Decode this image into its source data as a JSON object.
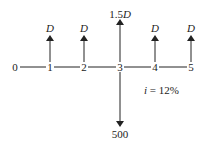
{
  "diagram": {
    "type": "cash-flow-diagram",
    "periods": [
      "0",
      "1",
      "2",
      "3",
      "4",
      "5"
    ],
    "inflows": [
      {
        "period": "1",
        "label": "D"
      },
      {
        "period": "2",
        "label": "D"
      },
      {
        "period": "3",
        "label_num": "1.5",
        "label_var": "D"
      },
      {
        "period": "4",
        "label": "D"
      },
      {
        "period": "5",
        "label": "D"
      }
    ],
    "outflows": [
      {
        "period": "3",
        "label": "500"
      }
    ],
    "interest": {
      "var": "i",
      "rest": " = 12%"
    },
    "colors": {
      "line": "#222222",
      "background": "#ffffff"
    }
  }
}
